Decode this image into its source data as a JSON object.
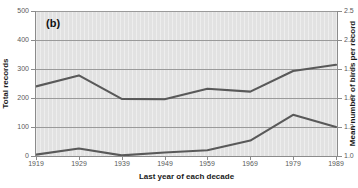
{
  "figure": {
    "panel_label": "(b)",
    "background_color": "#ffffff",
    "plot_background_color": "#e2e2e2",
    "line_color": "#595959",
    "axis_color": "#8b8b8b",
    "tick_label_color": "#5a5a5a"
  },
  "chart_data": {
    "type": "line",
    "title": "",
    "panel_label": "(b)",
    "xlabel": "Last year of each decade",
    "ylabel": "Total records",
    "ylabel_secondary": "Mean number of birds per record",
    "grid": true,
    "grid_axis": "y",
    "legend_position": "none",
    "x": [
      1919,
      1929,
      1939,
      1949,
      1959,
      1969,
      1979,
      1989
    ],
    "xtick_labels": [
      "1919",
      "1929",
      "1939",
      "1949",
      "1959",
      "1969",
      "1979",
      "1989"
    ],
    "xlim": [
      1919,
      1989
    ],
    "ylim": [
      0,
      500
    ],
    "ytick_labels": [
      "0",
      "100",
      "200",
      "300",
      "400",
      "500"
    ],
    "ytick_values": [
      0,
      100,
      200,
      300,
      400,
      500
    ],
    "ylim_secondary": [
      1.0,
      2.5
    ],
    "ytick_labels_secondary": [
      "1.0",
      "1.3",
      "1.6",
      "1.9",
      "2.2",
      "2.5"
    ],
    "ytick_values_secondary": [
      1.0,
      1.3,
      1.6,
      1.9,
      2.2,
      2.5
    ],
    "series": [
      {
        "name": "Total records",
        "axis": "left",
        "color": "#595959",
        "values": [
          240,
          278,
          197,
          196,
          232,
          222,
          293,
          315
        ]
      },
      {
        "name": "Mean number of birds per record",
        "axis": "right",
        "color": "#595959",
        "values": [
          5,
          26,
          2,
          12,
          20,
          53,
          142,
          100
        ],
        "values_secondary_axis": [
          1.02,
          1.08,
          1.01,
          1.04,
          1.06,
          1.16,
          1.43,
          1.3
        ]
      }
    ]
  },
  "axes": {
    "left_ticks": [
      {
        "label": "500",
        "value": 500
      },
      {
        "label": "400",
        "value": 400
      },
      {
        "label": "300",
        "value": 300
      },
      {
        "label": "200",
        "value": 200
      },
      {
        "label": "100",
        "value": 100
      },
      {
        "label": "0",
        "value": 0
      }
    ],
    "right_ticks": [
      {
        "label": "2.5",
        "value": 2.5
      },
      {
        "label": "2.2",
        "value": 2.2
      },
      {
        "label": "1.9",
        "value": 1.9
      },
      {
        "label": "1.6",
        "value": 1.6
      },
      {
        "label": "1.3",
        "value": 1.3
      },
      {
        "label": "1.0",
        "value": 1.0
      }
    ],
    "x_ticks": [
      {
        "label": "1919"
      },
      {
        "label": "1929"
      },
      {
        "label": "1939"
      },
      {
        "label": "1949"
      },
      {
        "label": "1959"
      },
      {
        "label": "1969"
      },
      {
        "label": "1979"
      },
      {
        "label": "1989"
      }
    ],
    "left_title": "Total records",
    "right_title": "Mean number of birds per record",
    "x_title": "Last year of each decade"
  }
}
